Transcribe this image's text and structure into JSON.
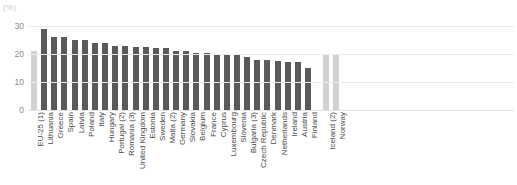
{
  "chart_data": {
    "type": "bar",
    "title": "",
    "xlabel": "",
    "ylabel": "",
    "unit_label": "(%)",
    "ylim": [
      0,
      30
    ],
    "yticks": [
      0,
      10,
      20,
      30
    ],
    "grid": true,
    "legend": "none",
    "colors": {
      "bar_default": "#5a5a5a",
      "bar_highlight": "#d2d2d2",
      "gridline": "#ececec",
      "tick_text": "#8c8c8c",
      "category_text": "#4a4a4a",
      "unit_text": "#c8c8c8",
      "background": "#ffffff"
    },
    "categories": [
      "EU-25 (1)",
      "Lithuania",
      "Greece",
      "Spain",
      "Latvia",
      "Poland",
      "Italy",
      "Hungary",
      "Portugal (2)",
      "Romania (3)",
      "United Kingdom",
      "Estonia",
      "Sweden",
      "Malta (2)",
      "Germany",
      "Slovakia",
      "Belgium",
      "France",
      "Cyprus",
      "Luxembourg",
      "Slovenia",
      "Bulgaria (3)",
      "Czech Republic",
      "Denmark",
      "Netherlands",
      "Ireland",
      "Austria",
      "Finland",
      "Iceland (2)",
      "Norway"
    ],
    "values": [
      21,
      29,
      26,
      26,
      25,
      25,
      24,
      24,
      23,
      23,
      22.5,
      22.5,
      22,
      22,
      21,
      21,
      20.5,
      20.5,
      20,
      20,
      19.5,
      19,
      18,
      18,
      17.5,
      17,
      17,
      15,
      19.5,
      19.5
    ],
    "highlighted": [
      "EU-25 (1)",
      "Iceland (2)",
      "Norway"
    ],
    "gap_after_index": 27
  }
}
